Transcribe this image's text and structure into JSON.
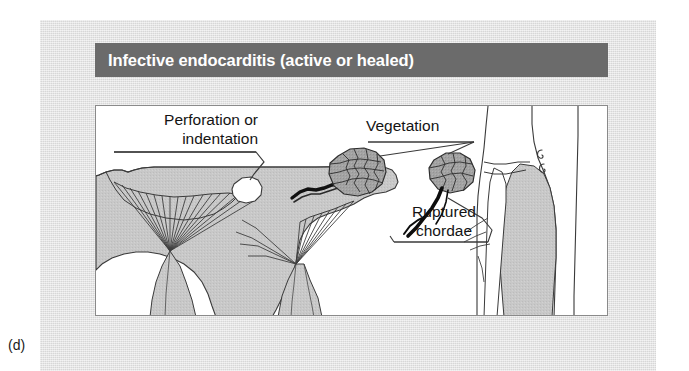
{
  "figure": {
    "caption": "(d)",
    "title": "Infective endocarditis (active or healed)",
    "title_bar_color": "#6b6b6b",
    "panel_color": "#e0e0e0",
    "illustration_background": "#ffffff",
    "ink_color": "#141414"
  },
  "annotations": {
    "perforation": {
      "line1": "Perforation or",
      "line2": "indentation"
    },
    "vegetation": {
      "line1": "Vegetation"
    },
    "ruptured_chordae": {
      "line1": "Ruptured",
      "line2": "chordae"
    }
  },
  "illustration": {
    "type": "medical-diagram",
    "subject": "mitral valve with infective endocarditis",
    "structures": [
      "valve-leaflet-left",
      "valve-leaflet-right",
      "chordae-tendineae-fan-left",
      "chordae-tendineae-fan-right",
      "papillary-muscle-left",
      "papillary-muscle-right",
      "perforation-hole",
      "vegetation-mass-leaflet",
      "vegetation-mass-chamber",
      "ruptured-chordae-strands",
      "chamber-cross-section"
    ],
    "tissue_fill": "#c6c6c6",
    "vegetation_fill": "#9a9a9a",
    "perforation_fill": "#ffffff"
  }
}
